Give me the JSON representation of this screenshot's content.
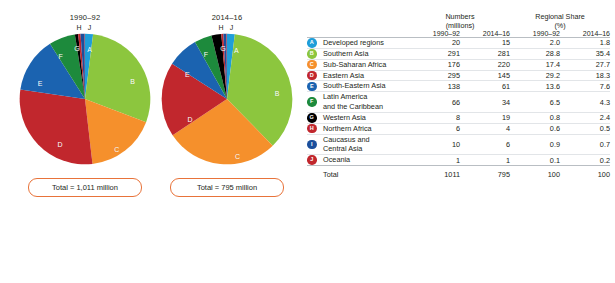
{
  "chart_data": {
    "type": "pie",
    "title": "",
    "subtitle": "",
    "unit_note": "millions",
    "categories": [
      "Developed regions",
      "Southern Asia",
      "Sub-Saharan Africa",
      "Eastern Asia",
      "South-Eastern Asia",
      "Latin America and the Caribbean",
      "Western Asia",
      "Northern Africa",
      "Caucasus and Central Asia",
      "Oceania"
    ],
    "letters": [
      "A",
      "B",
      "C",
      "D",
      "E",
      "F",
      "G",
      "H",
      "I",
      "J"
    ],
    "colors": [
      "#1f9ed9",
      "#8cc63e",
      "#f5902c",
      "#c1272d",
      "#1b63b0",
      "#1d8a3c",
      "#000000",
      "#c1272d",
      "#1b4f9c",
      "#c1272d"
    ],
    "series": [
      {
        "name": "1990-92",
        "total": 1011,
        "total_label": "Total = 1,011 million",
        "values": [
          20,
          291,
          176,
          295,
          138,
          66,
          8,
          6,
          10,
          1
        ],
        "shares": [
          2.0,
          28.8,
          17.4,
          29.2,
          13.6,
          6.5,
          0.8,
          0.6,
          0.9,
          0.1
        ]
      },
      {
        "name": "2014-16",
        "total": 795,
        "total_label": "Total = 795 million",
        "values": [
          15,
          281,
          220,
          145,
          61,
          34,
          19,
          4,
          6,
          1
        ],
        "shares": [
          1.8,
          35.4,
          27.7,
          18.3,
          7.6,
          4.3,
          2.4,
          0.5,
          0.7,
          0.2
        ]
      }
    ],
    "legend_position": "right-table",
    "grid": false
  },
  "pies": [
    {
      "title": "1990–92",
      "sublabels": "H J",
      "total_label": "Total = 1,011 million",
      "slice_labels": [
        {
          "letter": "A",
          "x": 53.5,
          "y": 12,
          "inside": true
        },
        {
          "letter": "B",
          "x": 86,
          "y": 36,
          "inside": true
        },
        {
          "letter": "C",
          "x": 74,
          "y": 88,
          "inside": true
        },
        {
          "letter": "D",
          "x": 31,
          "y": 84,
          "inside": true
        },
        {
          "letter": "E",
          "x": 16,
          "y": 38,
          "inside": true
        },
        {
          "letter": "F",
          "x": 31.5,
          "y": 17,
          "inside": true
        },
        {
          "letter": "G",
          "x": 44,
          "y": 11,
          "inside": true
        },
        {
          "letter": "H",
          "x": 49,
          "y": -8,
          "inside": false
        },
        {
          "letter": "J",
          "x": 58,
          "y": -8,
          "inside": false
        }
      ]
    },
    {
      "title": "2014–16",
      "sublabels": "H J",
      "total_label": "Total = 795 million",
      "slice_labels": [
        {
          "letter": "A",
          "x": 57,
          "y": 13,
          "inside": true
        },
        {
          "letter": "B",
          "x": 88,
          "y": 45,
          "inside": true
        },
        {
          "letter": "C",
          "x": 58,
          "y": 93,
          "inside": true
        },
        {
          "letter": "D",
          "x": 22,
          "y": 65,
          "inside": true
        },
        {
          "letter": "E",
          "x": 20,
          "y": 31,
          "inside": true
        },
        {
          "letter": "F",
          "x": 34,
          "y": 16,
          "inside": true
        },
        {
          "letter": "G",
          "x": 47,
          "y": 11,
          "inside": true
        },
        {
          "letter": "H",
          "x": 49,
          "y": -8,
          "inside": false
        },
        {
          "letter": "J",
          "x": 58,
          "y": -8,
          "inside": false
        }
      ]
    }
  ],
  "table": {
    "group_headers": [
      {
        "line1": "Numbers",
        "line2": "(millions)"
      },
      {
        "line1": "Regional Share",
        "line2": "(%)"
      }
    ],
    "sub_headers": [
      "1990–92",
      "2014–16",
      "1990–92",
      "2014–16"
    ],
    "rows": [
      {
        "letter": "A",
        "color": "#1f9ed9",
        "region": "Developed regions",
        "n1": "20",
        "n2": "15",
        "s1": "2.0",
        "s2": "1.8"
      },
      {
        "letter": "B",
        "color": "#8cc63e",
        "region": "Southern Asia",
        "n1": "291",
        "n2": "281",
        "s1": "28.8",
        "s2": "35.4"
      },
      {
        "letter": "C",
        "color": "#f5902c",
        "region": "Sub-Saharan Africa",
        "n1": "176",
        "n2": "220",
        "s1": "17.4",
        "s2": "27.7"
      },
      {
        "letter": "D",
        "color": "#c1272d",
        "region": "Eastern Asia",
        "n1": "295",
        "n2": "145",
        "s1": "29.2",
        "s2": "18.3"
      },
      {
        "letter": "E",
        "color": "#1b63b0",
        "region": "South-Eastern Asia",
        "n1": "138",
        "n2": "61",
        "s1": "13.6",
        "s2": "7.6"
      },
      {
        "letter": "F",
        "color": "#1d8a3c",
        "region": "Latin America\nand the Caribbean",
        "n1": "66",
        "n2": "34",
        "s1": "6.5",
        "s2": "4.3"
      },
      {
        "letter": "G",
        "color": "#000000",
        "region": "Western Asia",
        "n1": "8",
        "n2": "19",
        "s1": "0.8",
        "s2": "2.4"
      },
      {
        "letter": "H",
        "color": "#c1272d",
        "region": "Northern Africa",
        "n1": "6",
        "n2": "4",
        "s1": "0.6",
        "s2": "0.5"
      },
      {
        "letter": "I",
        "color": "#1b4f9c",
        "region": "Caucasus and\nCentral Asia",
        "n1": "10",
        "n2": "6",
        "s1": "0.9",
        "s2": "0.7"
      },
      {
        "letter": "J",
        "color": "#c1272d",
        "region": "Oceania",
        "n1": "1",
        "n2": "1",
        "s1": "0.1",
        "s2": "0.2"
      }
    ],
    "total_row": {
      "label": "Total",
      "n1": "1011",
      "n2": "795",
      "s1": "100",
      "s2": "100"
    }
  }
}
